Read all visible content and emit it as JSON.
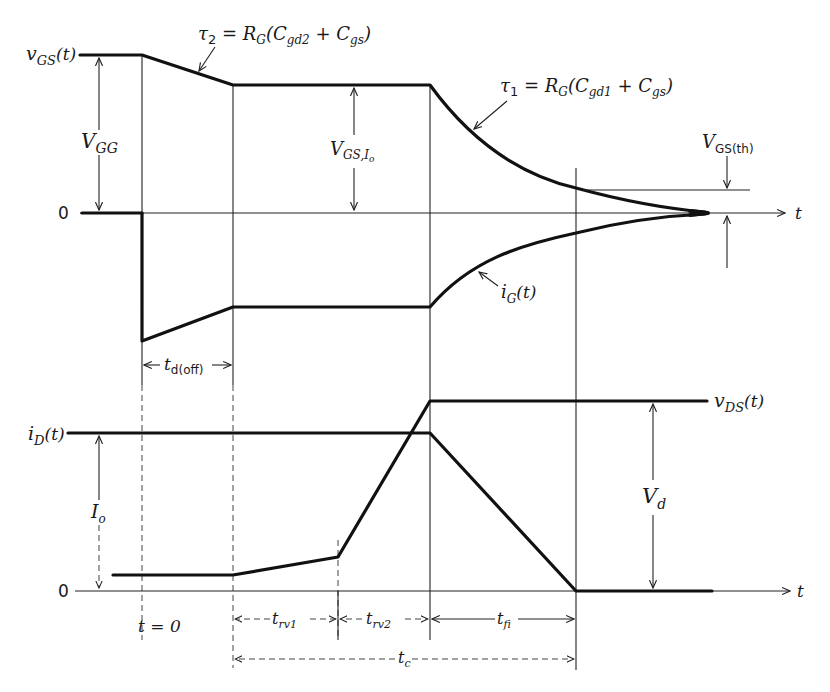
{
  "diagram": {
    "top_panel": {
      "vgs_label": "v",
      "vgs_sub": "GS",
      "vgs_arg": "(t)",
      "zero_label": "0",
      "vgg_label": "V",
      "vgg_sub": "GG",
      "vgsio_label": "V",
      "vgsio_sub": "GS,I",
      "vgsio_subsub": "o",
      "tau2_label": "τ",
      "tau2_sub": "2",
      "tau2_eq": " = R",
      "tau2_rg_sub": "G",
      "tau2_open": "(C",
      "tau2_c1_sub": "gd2",
      "tau2_plus": " + C",
      "tau2_c2_sub": "gs",
      "tau2_close": ")",
      "tau1_label": "τ",
      "tau1_sub": "1",
      "tau1_eq": " = R",
      "tau1_rg_sub": "G",
      "tau1_open": "(C",
      "tau1_c1_sub": "gd1",
      "tau1_plus": " + C",
      "tau1_c2_sub": "gs",
      "tau1_close": ")",
      "vth_label": "V",
      "vth_sub": "GS(th)",
      "ig_label": "i",
      "ig_sub": "G",
      "ig_arg": "(t)",
      "t_axis": "t",
      "tdoff_label": "t",
      "tdoff_sub": "d(off)"
    },
    "bottom_panel": {
      "id_label": "i",
      "id_sub": "D",
      "id_arg": "(t)",
      "vds_label": "v",
      "vds_sub": "DS",
      "vds_arg": "(t)",
      "io_label": "I",
      "io_sub": "o",
      "vd_label": "V",
      "vd_sub": "d",
      "zero_label": "0",
      "t_axis": "t",
      "t0_label": "t = 0",
      "trv1_label": "t",
      "trv1_sub": "rv1",
      "trv2_label": "t",
      "trv2_sub": "rv2",
      "tfi_label": "t",
      "tfi_sub": "fi",
      "tc_label": "t",
      "tc_sub": "c"
    },
    "colors": {
      "ink": "#111111",
      "background": "#ffffff"
    }
  }
}
